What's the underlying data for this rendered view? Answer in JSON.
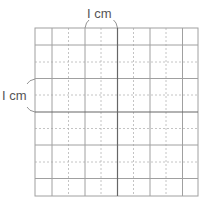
{
  "diagram": {
    "type": "grid",
    "columns": 10,
    "rows": 10,
    "cell_unit_cm": 0.5,
    "top_label": "I cm",
    "left_label": "I cm",
    "colors": {
      "grid": "#9a9a9a",
      "axis": "#555555",
      "dashed": "#b0b0b0",
      "label": "#555555"
    }
  }
}
